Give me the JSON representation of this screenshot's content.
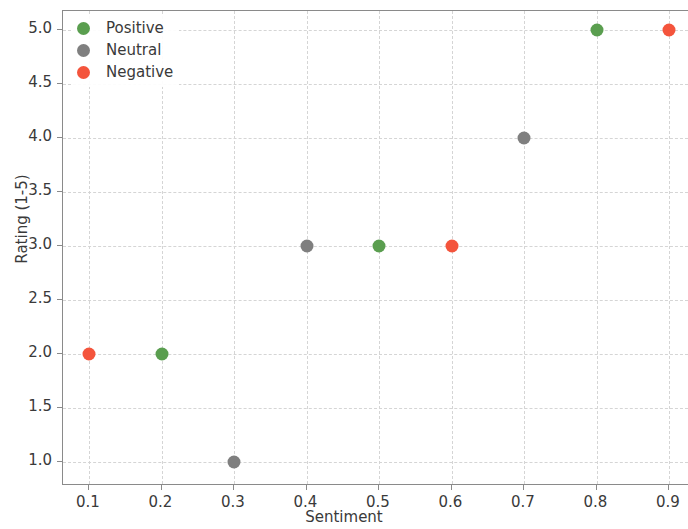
{
  "chart_data": {
    "type": "scatter",
    "title": "",
    "xlabel": "Sentiment",
    "ylabel": "Rating (1-5)",
    "xlim": [
      0.05,
      0.95
    ],
    "ylim": [
      0.8,
      5.2
    ],
    "grid": true,
    "legend_position": "upper left",
    "xticks": [
      "0.1",
      "0.2",
      "0.3",
      "0.4",
      "0.5",
      "0.6",
      "0.7",
      "0.8",
      "0.9"
    ],
    "xtick_values": [
      0.1,
      0.2,
      0.3,
      0.4,
      0.5,
      0.6,
      0.7,
      0.8,
      0.9
    ],
    "yticks": [
      "1.0",
      "1.5",
      "2.0",
      "2.5",
      "3.0",
      "3.5",
      "4.0",
      "4.5",
      "5.0"
    ],
    "ytick_values": [
      1.0,
      1.5,
      2.0,
      2.5,
      3.0,
      3.5,
      4.0,
      4.5,
      5.0
    ],
    "colors": {
      "positive": "#5a9e4f",
      "neutral": "#7f7f7f",
      "negative": "#f4543c"
    },
    "series": [
      {
        "name": "Positive",
        "color": "#5a9e4f",
        "points": [
          {
            "x": 0.2,
            "y": 2.0
          },
          {
            "x": 0.5,
            "y": 3.0
          },
          {
            "x": 0.8,
            "y": 5.0
          }
        ]
      },
      {
        "name": "Neutral",
        "color": "#7f7f7f",
        "points": [
          {
            "x": 0.3,
            "y": 1.0
          },
          {
            "x": 0.4,
            "y": 3.0
          },
          {
            "x": 0.7,
            "y": 4.0
          }
        ]
      },
      {
        "name": "Negative",
        "color": "#f4543c",
        "points": [
          {
            "x": 0.1,
            "y": 2.0
          },
          {
            "x": 0.6,
            "y": 3.0
          },
          {
            "x": 0.9,
            "y": 5.0
          }
        ]
      }
    ]
  }
}
